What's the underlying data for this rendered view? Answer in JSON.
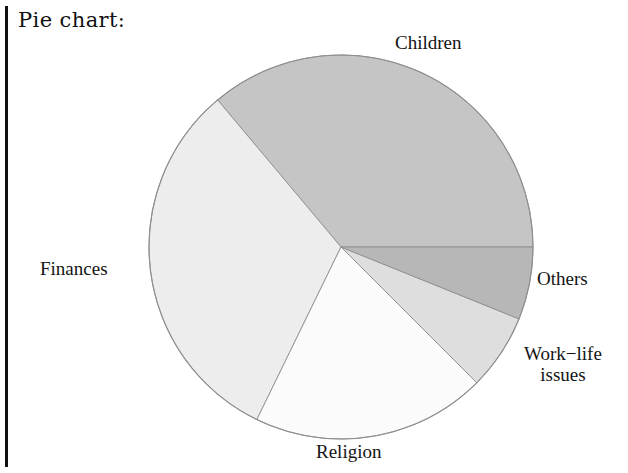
{
  "caption": "Pie chart:",
  "labels": {
    "children": "Children",
    "finances": "Finances",
    "others": "Others",
    "worklife_line1": "Work−life",
    "worklife_line2": "issues",
    "religion": "Religion"
  },
  "chart_data": {
    "type": "pie",
    "title": "Pie chart:",
    "xlabel": "",
    "ylabel": "",
    "grid": false,
    "legend_position": "outside-labels",
    "categories": [
      "Children",
      "Finances",
      "Religion",
      "Work−life issues",
      "Others"
    ],
    "values": [
      36.1,
      31.7,
      19.7,
      6.4,
      6.1
    ],
    "units": "percent",
    "slices": [
      {
        "label": "Children",
        "value": 36.1,
        "sweep_degrees": 130,
        "start_angle_deg": 0,
        "end_angle_deg": 130,
        "color": "#c5c5c5",
        "label_position": "top-right"
      },
      {
        "label": "Finances",
        "value": 31.7,
        "sweep_degrees": 114,
        "start_angle_deg": 130,
        "end_angle_deg": 244,
        "color": "#ededed",
        "label_position": "left"
      },
      {
        "label": "Religion",
        "value": 19.7,
        "sweep_degrees": 71,
        "start_angle_deg": 244,
        "end_angle_deg": 315,
        "color": "#fbfbfb",
        "label_position": "bottom"
      },
      {
        "label": "Work−life issues",
        "value": 6.4,
        "sweep_degrees": 23,
        "start_angle_deg": 315,
        "end_angle_deg": 338,
        "color": "#dedede",
        "label_position": "bottom-right"
      },
      {
        "label": "Others",
        "value": 6.1,
        "sweep_degrees": 22,
        "start_angle_deg": 338,
        "end_angle_deg": 360,
        "color": "#b7b7b7",
        "label_position": "right"
      }
    ],
    "geometry": {
      "center_x": 341,
      "center_y": 247,
      "radius": 192,
      "outline_color": "#8f8f8f"
    }
  },
  "colors": {
    "rule": "#111111",
    "text": "#141414",
    "background": "#ffffff"
  }
}
